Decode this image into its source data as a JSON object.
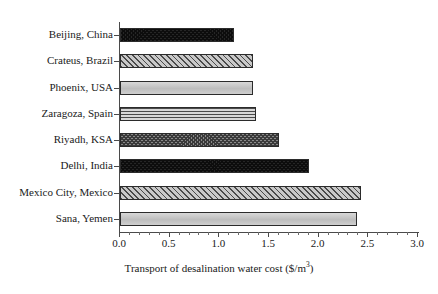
{
  "chart_data": {
    "type": "bar",
    "orientation": "horizontal",
    "title": "",
    "xlabel": "Transport of desalination water cost ($/m",
    "xlabel_superscript": "3",
    "xlabel_suffix": ")",
    "ylabel": "",
    "categories": [
      "Beijing, China",
      "Crateus, Brazil",
      "Phoenix, USA",
      "Zaragoza, Spain",
      "Riyadh, KSA",
      "Delhi, India",
      "Mexico City, Mexico",
      "Sana, Yemen"
    ],
    "values": [
      1.15,
      1.34,
      1.34,
      1.37,
      1.6,
      1.9,
      2.43,
      2.39
    ],
    "xlim": [
      0.0,
      3.0
    ],
    "xticks": [
      0.0,
      0.5,
      1.0,
      1.5,
      2.0,
      2.5,
      3.0
    ],
    "xtick_labels": [
      "0.0",
      "0.5",
      "1.0",
      "1.5",
      "2.0",
      "2.5",
      "3.0"
    ],
    "xtick_minor_step": 0.1,
    "grid": false,
    "legend": false,
    "bar_patterns": [
      "checker-dark",
      "diagonal",
      "solid-light",
      "horizontal",
      "checker-mid",
      "checker-dark",
      "diagonal",
      "solid-light"
    ],
    "colors": {
      "axis": "#4a4a4a",
      "text": "#1a1a1a",
      "background": "#ffffff",
      "bar_outline": "#2b2b2b"
    }
  }
}
